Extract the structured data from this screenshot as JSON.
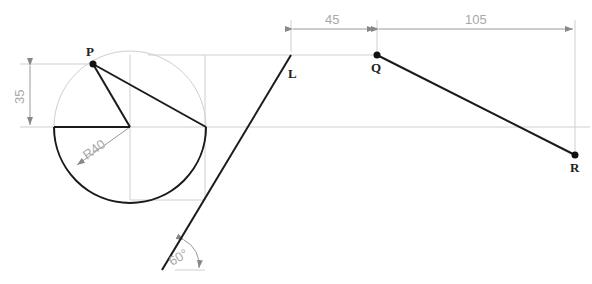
{
  "diagram": {
    "type": "geometric construction drawing",
    "points": [
      {
        "name": "P",
        "label": "P"
      },
      {
        "name": "L",
        "label": "L"
      },
      {
        "name": "Q",
        "label": "Q"
      },
      {
        "name": "R",
        "label": "R"
      }
    ],
    "dimensions": {
      "vertical_offset": "35",
      "radius": "R40",
      "horizontal_LQ": "45",
      "horizontal_QR": "105",
      "angle": "60°"
    },
    "colors": {
      "object_line": "#1a1a1a",
      "construction_line": "#c8c8c8",
      "dimension_text": "#a8a8a8"
    }
  }
}
